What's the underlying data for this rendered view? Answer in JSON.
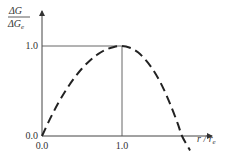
{
  "chart_data": {
    "type": "line",
    "title": "",
    "ylabel_num": "ΔG",
    "ylabel_den": "ΔG",
    "ylabel_den_sub": "e",
    "xlabel_main": "r / r",
    "xlabel_sub": "e",
    "xlim": [
      0,
      2.1
    ],
    "ylim": [
      -0.2,
      1.3
    ],
    "x_ticks": [
      {
        "value": 0.0,
        "label": "0.0"
      },
      {
        "value": 1.0,
        "label": "1.0"
      }
    ],
    "y_ticks": [
      {
        "value": 0.0,
        "label": "0.0"
      },
      {
        "value": 1.0,
        "label": "1.0"
      }
    ],
    "grid": false,
    "series": [
      {
        "name": "ΔG/ΔGe curve",
        "style": "dashed",
        "color": "#222222",
        "x": [
          0.0,
          0.1,
          0.2,
          0.3,
          0.4,
          0.5,
          0.6,
          0.7,
          0.8,
          0.9,
          1.0,
          1.1,
          1.2,
          1.3,
          1.4,
          1.5,
          1.6,
          1.7,
          1.75,
          1.85
        ],
        "y": [
          0.0,
          0.19,
          0.36,
          0.51,
          0.64,
          0.75,
          0.84,
          0.91,
          0.96,
          0.99,
          1.0,
          0.98,
          0.93,
          0.84,
          0.72,
          0.56,
          0.36,
          0.13,
          0.0,
          -0.16
        ]
      }
    ],
    "reference_lines": [
      {
        "type": "horizontal",
        "y": 1.0,
        "x_from": 0.0,
        "x_to": 1.0
      },
      {
        "type": "vertical",
        "x": 1.0,
        "y_from": 0.0,
        "y_to": 1.0
      }
    ]
  }
}
